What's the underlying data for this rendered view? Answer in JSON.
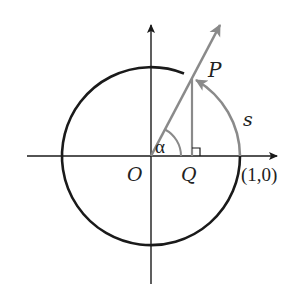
{
  "diagram": {
    "labels": {
      "P": "P",
      "s": "s",
      "alpha": "α",
      "O": "O",
      "Q": "Q",
      "point_1_0": "(1,0)"
    },
    "colors": {
      "circle": "#1a1a1a",
      "axes": "#1a1a1a",
      "ray": "#8a8a8a",
      "arc_s": "#8a8a8a",
      "perpendicular": "#8a8a8a"
    },
    "geometry": {
      "origin": [
        151,
        156
      ],
      "radius": 89,
      "angle_alpha_deg": 60
    }
  }
}
